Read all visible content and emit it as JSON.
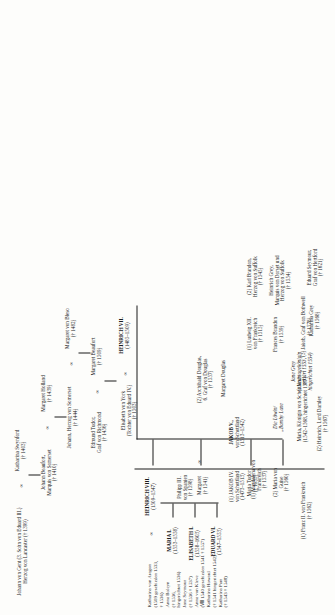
{
  "diagram": {
    "marriage_symbol": "∞",
    "death_symbol": "†",
    "nodes": {
      "johann_von_gent": {
        "lines": [
          "Johann von Gent (3. Sohn von Eduard III.)",
          "Herzog von Lancaster († 1399)"
        ]
      },
      "katharina_swynford": {
        "lines": [
          "Katharina Swynford",
          "(† 1403)"
        ]
      },
      "johann_beaufort": {
        "lines": [
          "Johann Beaufort,",
          "Marquis von Somerset",
          "(† 1410)"
        ]
      },
      "margaret_holland": {
        "lines": [
          "Margaret Holland",
          "(† 1439)"
        ]
      },
      "johann_herzog_somerset": {
        "lines": [
          "Johann, Herzog von Somerset",
          "(† 1444)"
        ]
      },
      "margaret_von_bleso": {
        "lines": [
          "Margaret von Bleso",
          "(† 1482)"
        ]
      },
      "edmund_tudor": {
        "lines": [
          "Edmund Tudor,",
          "Graf von Richmond",
          "(† 1456)"
        ]
      },
      "margaret_beaufort": {
        "lines": [
          "Margaret Beaufort",
          "(† 1509)"
        ]
      },
      "heinrich_vii": {
        "lines": [
          "HEINRICH VII.",
          "(1485–1509)"
        ],
        "bold": true
      },
      "elisabeth_von_york": {
        "lines": [
          "Elisabeth von York",
          "(Tochter von Eduard IV.)",
          "(† 1503)"
        ]
      },
      "heinrich_viii": {
        "lines": [
          "HEINRICH VIII.",
          "(1509–1547)"
        ],
        "bold": true
      },
      "maria_i": {
        "lines": [
          "MARIA I.",
          "(1553–1558)"
        ],
        "bold": true
      },
      "elisabeth_i": {
        "lines": [
          "ELISABETH I.",
          "(1558–1603)"
        ],
        "bold": true
      },
      "eduard_vi": {
        "lines": [
          "EDUARD VI.",
          "(1547–1553)"
        ],
        "bold": true
      },
      "margaret_1541": {
        "lines": [
          "Margaret",
          "(† 1541)"
        ]
      },
      "maria_1533": {
        "lines": [
          "Maria Tudor",
          "(† 1533)"
        ]
      },
      "jakob_iv": {
        "lines": [
          "(1) JAKOB IV.",
          "von Schottland",
          "(1473–1513)"
        ]
      },
      "philipp_iii": {
        "lines": [
          "Philipp III.",
          "von Spanien",
          "(† 1598)"
        ]
      },
      "ludwig_xii": {
        "lines": [
          "(1) Ludwig XII.",
          "von Frankreich",
          "(† 1515)"
        ]
      },
      "karl_brandon": {
        "lines": [
          "(2) Karl Brandon,",
          "Herzog von Suffolk",
          "(† 1545)"
        ]
      },
      "archibald_douglas": {
        "lines": [
          "(2) Archibald Douglas,",
          "6. Graf von Douglas",
          "(† 1557)"
        ]
      },
      "magdalena_von_frankreich": {
        "lines": [
          "(1) Magdalena von",
          "Frankreich",
          "(† 1537)"
        ]
      },
      "maria_von_guise": {
        "lines": [
          "(2) Maria von",
          "Guise",
          "(† 1560)"
        ]
      },
      "jakob_v": {
        "lines": [
          "JAKOB V.,",
          "von Schottland",
          "(1513–1542)"
        ],
        "bold": true
      },
      "margaret_douglas": {
        "lines": [
          "Margaret Douglas"
        ]
      },
      "franz_brandon": {
        "lines": [
          "Frances Brandon",
          "(† 1559)"
        ]
      },
      "heinrich_grey": {
        "lines": [
          "Heinrich Grey,",
          "Marquis von Dorset und",
          "Herzog von Suffolk",
          "(† 1554)"
        ]
      },
      "katharina_grey": {
        "lines": [
          "Katharina Grey",
          "(† 1568)"
        ]
      },
      "eduard_seymour": {
        "lines": [
          "Eduard Seymour,",
          "Graf von Hertford",
          "(† 1621)"
        ]
      },
      "jane_grey": {
        "lines": [
          "Jane Grey",
          "(„Neuntagekönigin",
          "erklärt 1553,",
          "hingerichtet 1554)"
        ],
        "italic": true
      },
      "die_loewin": {
        "lines": [
          "Die Löwin/",
          "„Bamby Lane"
        ],
        "italic": true
      },
      "maria_koenigin_schottland": {
        "lines": [
          "Maria, Königin von Schottland",
          "(1542–1568, hingerichtet 1587)"
        ]
      },
      "franz_ii": {
        "lines": [
          "(1) Franz II. von Frankreich",
          "(† 1562)"
        ]
      },
      "heinrich_darnley": {
        "lines": [
          "(2) Heinrich, Lord Darnley",
          "(† 1567)"
        ]
      },
      "jakob_bothwell": {
        "lines": [
          "(3) Jakob, Graf von Bothwell",
          "(† 1578)"
        ]
      }
    },
    "wives_list": {
      "spouse_label": "Katharina von Aragon",
      "spouse_dates": "(† 1536)",
      "order_label": "(1 1502)",
      "entries": [
        {
          "n": "(1)",
          "lines": [
            "Katharina von Aragon",
            "(1509 geschieden 1533,",
            "† 1536)"
          ]
        },
        {
          "n": "(2)",
          "lines": [
            "Anna Boleyn",
            "(† 1536,",
            "hingerichtet 1536)"
          ]
        },
        {
          "n": "(3)",
          "lines": [
            "Jane Seymour",
            "(† 1536 † 1537)"
          ]
        },
        {
          "n": "(4)",
          "lines": [
            "Anna von Kleve",
            "(Ⅷ1540 geschieden 1541 † 1557)"
          ]
        },
        {
          "n": "(5)",
          "lines": [
            "Katharina Howard",
            "(† 1541 hingerichtet 1542)"
          ]
        },
        {
          "n": "(6)",
          "lines": [
            "Katharina Parr",
            "(† 1543 † 1548)"
          ]
        }
      ]
    }
  }
}
